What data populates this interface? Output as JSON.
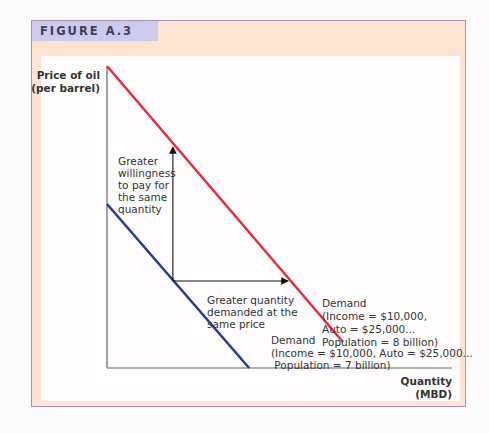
{
  "figure": {
    "title": "FIGURE A.3"
  },
  "colors": {
    "frame_bg": "#fde3d2",
    "title_bar": "#cfc9ec",
    "demand_8b": "#e0323c",
    "demand_7b": "#2c3c8c",
    "axis": "#555555",
    "arrow": "#111111"
  },
  "chart_data": {
    "type": "line",
    "title": "FIGURE A.3",
    "ylabel": [
      "Price of oil",
      "(per barrel)"
    ],
    "xlabel": [
      "Quantity",
      "(MBD)"
    ],
    "xlim": [
      0,
      1
    ],
    "ylim": [
      0,
      1
    ],
    "grid": false,
    "ticks": "none",
    "series": [
      {
        "name": "Demand (Population = 8 billion)",
        "label_lines": [
          "Demand",
          "(Income = $10,000,",
          "Auto = $25,000...",
          "Population = 8 billion)"
        ],
        "color": "#e0323c",
        "x": [
          0,
          0.684
        ],
        "y": [
          1.0,
          0.086
        ]
      },
      {
        "name": "Demand (Population = 7 billion)",
        "label_lines": [
          "Demand",
          "(Income = $10,000, Auto = $25,000...",
          " Population = 7 billion)"
        ],
        "color": "#2c3c8c",
        "x": [
          0,
          0.412
        ],
        "y": [
          0.543,
          0
        ]
      }
    ],
    "annotations": [
      {
        "type": "arrow",
        "from": [
          0.191,
          0.288
        ],
        "to": [
          0.191,
          0.732
        ],
        "text_lines": [
          "Greater",
          "willingness",
          "to pay for",
          "the same",
          "quantity"
        ]
      },
      {
        "type": "arrow",
        "from": [
          0.191,
          0.288
        ],
        "to": [
          0.525,
          0.288
        ],
        "text_lines": [
          "Greater quantity",
          "demanded at the",
          "same price"
        ]
      }
    ]
  }
}
